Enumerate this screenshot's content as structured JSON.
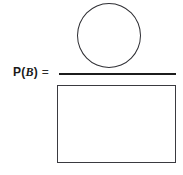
{
  "figure": {
    "kind": "probability-fraction-diagram",
    "width": 183,
    "height": 175,
    "background_color": "#ffffff",
    "line_color": "#2e2e33",
    "bar_color": "#1c1c1c",
    "text_color": "#1a1a1a"
  },
  "formula": {
    "function_name": "P",
    "open_paren": "(",
    "event_variable": "B",
    "close_paren": ")",
    "equals_sign": "=",
    "full_text": "P(B) ="
  },
  "numerator": {
    "shape": "circle",
    "semantic": "event-B-region",
    "fill": "none",
    "stroke": "#2e2e33"
  },
  "denominator": {
    "shape": "rectangle",
    "semantic": "sample-space-region",
    "fill": "none",
    "stroke": "#3a3a40"
  },
  "fraction_bar": {
    "semantic": "division-line",
    "color": "#1c1c1c"
  }
}
